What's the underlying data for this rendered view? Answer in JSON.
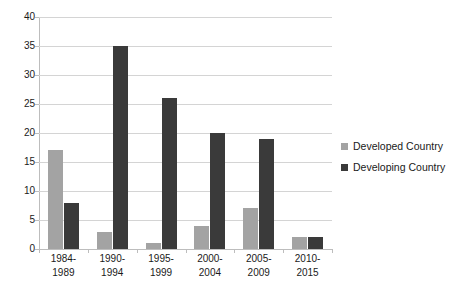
{
  "chart_data": {
    "type": "bar",
    "title": "",
    "subtitle": "",
    "xlabel": "",
    "ylabel": "",
    "ylim": [
      0,
      40
    ],
    "ytick_step": 5,
    "yticks": [
      "40",
      "35",
      "30",
      "25",
      "20",
      "15",
      "10",
      "5",
      "0"
    ],
    "grid": true,
    "legend_position": "right",
    "categories": [
      "1984-\n1989",
      "1990-\n1994",
      "1995-\n1999",
      "2000-\n2004",
      "2005-\n2009",
      "2010-\n2015"
    ],
    "category_lines": [
      {
        "line1": "1984-",
        "line2": "1989"
      },
      {
        "line1": "1990-",
        "line2": "1994"
      },
      {
        "line1": "1995-",
        "line2": "1999"
      },
      {
        "line1": "2000-",
        "line2": "2004"
      },
      {
        "line1": "2005-",
        "line2": "2009"
      },
      {
        "line1": "2010-",
        "line2": "2015"
      }
    ],
    "series": [
      {
        "name": "Developed Country",
        "color": "#a3a3a3",
        "values": [
          17,
          3,
          1,
          4,
          7,
          2
        ]
      },
      {
        "name": "Developing Country",
        "color": "#3a3a3a",
        "values": [
          8,
          35,
          26,
          20,
          19,
          2
        ]
      }
    ]
  },
  "legend": {
    "items": [
      {
        "label": "Developed Country",
        "color": "#a3a3a3"
      },
      {
        "label": "Developing Country",
        "color": "#3a3a3a"
      }
    ]
  },
  "colors": {
    "developed": "#a3a3a3",
    "developing": "#3a3a3a",
    "gridline": "#d4d4d4",
    "axis": "#bdbdbd",
    "background": "#ffffff",
    "text": "#1a1a1a"
  }
}
